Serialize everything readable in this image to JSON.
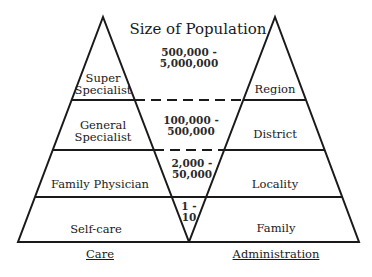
{
  "title": "Size of Population",
  "care_pyramid": {
    "label": "Care",
    "tiers": [
      {
        "label": "Super\nSpecialist",
        "line1": "Super",
        "line2": "Specialist"
      },
      {
        "label": "General\nSpecialist",
        "line1": "General",
        "line2": "Specialist"
      },
      {
        "label": "Family Physician"
      },
      {
        "label": "Self-care"
      }
    ]
  },
  "administration_pyramid": {
    "label": "Administration",
    "tiers": [
      {
        "label": "Region"
      },
      {
        "label": "District"
      },
      {
        "label": "Locality"
      },
      {
        "label": "Family"
      }
    ]
  },
  "population_sizes": [
    {
      "line1": "500,000 -",
      "line2": "5,000,000"
    },
    {
      "line1": "100,000 -",
      "line2": "500,000"
    },
    {
      "line1": "2,000 -",
      "line2": "50,000"
    },
    {
      "line1": "1 -",
      "line2": "10"
    }
  ],
  "colors": {
    "line": "#1a1a1a",
    "background": "#ffffff"
  }
}
